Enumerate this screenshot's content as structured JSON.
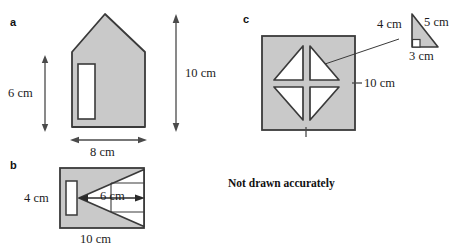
{
  "page": {
    "width": 457,
    "height": 249,
    "background": "#ffffff",
    "cropped_header_text": "exercise continued"
  },
  "style": {
    "shape_fill": "#c9c9c9",
    "shape_stroke": "#3a3a3a",
    "cutout_fill": "#ffffff",
    "dimension_stroke": "#4a4a4a",
    "text_color": "#1c1c1c"
  },
  "note": {
    "text": "Not drawn accurately"
  },
  "parts": [
    {
      "key": "a",
      "label": "a",
      "shape": "house-pentagon-with-door",
      "dimensions": [
        {
          "name": "height-left",
          "value": "6 cm",
          "orientation": "vertical"
        },
        {
          "name": "height-total",
          "value": "10 cm",
          "orientation": "vertical"
        },
        {
          "name": "width-base",
          "value": "8 cm",
          "orientation": "horizontal"
        }
      ]
    },
    {
      "key": "b",
      "label": "b",
      "shape": "rectangle-with-triangle-cutout",
      "dimensions": [
        {
          "name": "height-left",
          "value": "4 cm",
          "orientation": "horizontal-text"
        },
        {
          "name": "triangle-height",
          "value": "6 cm",
          "orientation": "horizontal"
        },
        {
          "name": "width-base",
          "value": "10 cm",
          "orientation": "horizontal"
        }
      ]
    },
    {
      "key": "c",
      "label": "c",
      "shape": "square-with-four-triangle-cutouts",
      "dimensions": [
        {
          "name": "square-side",
          "value": "10 cm",
          "orientation": "vertical-tick"
        }
      ],
      "inset_triangle": {
        "name": "right-triangle-detail",
        "dimensions": [
          {
            "name": "side-vertical",
            "value": "4 cm"
          },
          {
            "name": "hypotenuse",
            "value": "5 cm"
          },
          {
            "name": "side-base",
            "value": "3 cm"
          }
        ],
        "right_angle_marker": true
      }
    }
  ],
  "labels": {
    "a_part": "a",
    "b_part": "b",
    "c_part": "c",
    "a_six": "6 cm",
    "a_ten": "10 cm",
    "a_eight": "8 cm",
    "b_four": "4 cm",
    "b_six": "6 cm",
    "b_ten": "10 cm",
    "c_ten": "10 cm",
    "c_tri_four": "4 cm",
    "c_tri_five": "5 cm",
    "c_tri_three": "3 cm"
  }
}
